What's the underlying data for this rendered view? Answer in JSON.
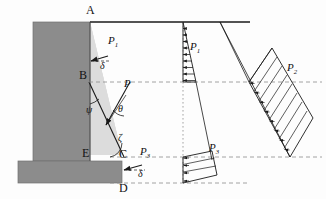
{
  "figure": {
    "type": "engineering-diagram",
    "colors": {
      "wall_fill": "#8c8c8c",
      "wall_stroke": "#6f6f6f",
      "soil_wedge_fill": "#d9d9d9",
      "line": "#1a1a1a",
      "dashed": "#7a7a7a",
      "background": "#fdfdfd"
    },
    "points": [
      {
        "id": "A",
        "label": "A",
        "x": 90,
        "y": 15
      },
      {
        "id": "B",
        "label": "B",
        "x": 83,
        "y": 77
      },
      {
        "id": "C",
        "label": "C",
        "x": 122,
        "y": 155
      },
      {
        "id": "D",
        "label": "D",
        "x": 122,
        "y": 183
      },
      {
        "id": "E",
        "label": "E",
        "x": 88,
        "y": 155
      }
    ],
    "angles": [
      {
        "id": "delta-top",
        "label": "δ",
        "x": 104,
        "y": 54
      },
      {
        "id": "psi",
        "label": "ψ",
        "x": 90,
        "y": 113
      },
      {
        "id": "theta",
        "label": "θ",
        "x": 122,
        "y": 112
      },
      {
        "id": "zeta",
        "label": "ζ",
        "x": 122,
        "y": 140
      },
      {
        "id": "delta-bottom",
        "label": "δ",
        "x": 146,
        "y": 170
      }
    ],
    "forces": [
      {
        "id": "P1-wall",
        "base": "P",
        "sub": "1",
        "x": 113,
        "y": 38
      },
      {
        "id": "P-wedge",
        "base": "P",
        "sub": "",
        "x": 127,
        "y": 88
      },
      {
        "id": "P3-wall",
        "base": "P",
        "sub": "3",
        "x": 147,
        "y": 150
      },
      {
        "id": "P1-diagram",
        "base": "P",
        "sub": "1",
        "x": 192,
        "y": 48
      },
      {
        "id": "P2-diagram",
        "base": "P",
        "sub": "2",
        "x": 292,
        "y": 69
      },
      {
        "id": "P3-diagram",
        "base": "P",
        "sub": "3",
        "x": 213,
        "y": 148
      }
    ],
    "pressure_diagrams": [
      {
        "id": "P1",
        "shape": "triangular",
        "orientation": "vertical",
        "arrow_count": 9,
        "description": "Triangular active pressure over wall segment A-B, arrows point left toward wall"
      },
      {
        "id": "P2",
        "shape": "parallelogram",
        "orientation": "inclined",
        "arrow_count": 7,
        "description": "Inclined hatched pressure block acting along failure plane"
      },
      {
        "id": "P3",
        "shape": "trapezoidal",
        "orientation": "inclined",
        "arrow_count": 3,
        "description": "Small trapezoidal pressure block over wall segment C-D"
      }
    ],
    "ground_surface": {
      "label": "",
      "from_x": 90,
      "to_x": 250,
      "y": 22
    }
  }
}
